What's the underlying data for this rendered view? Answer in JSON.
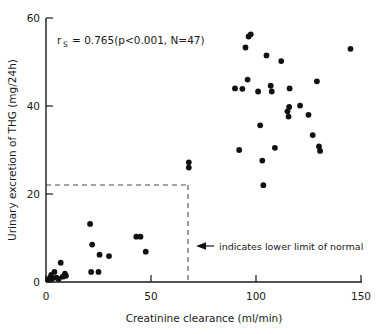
{
  "chart_data": {
    "type": "scatter",
    "title": "",
    "xlabel": "Creatinine clearance (ml/min)",
    "ylabel": "Urinary excretion of THG (mg/24h)",
    "xlim": [
      0,
      150
    ],
    "ylim": [
      0,
      60
    ],
    "xticks": [
      "0",
      "50",
      "100",
      "150"
    ],
    "xtick_values": [
      0,
      50,
      100,
      150
    ],
    "yticks": [
      "0",
      "20",
      "40",
      "60"
    ],
    "ytick_values": [
      0,
      20,
      40,
      60
    ],
    "grid": false,
    "legend": "none",
    "marker": "filled-circle",
    "marker_color": "#101010",
    "series": [
      {
        "name": "Patients",
        "points": [
          [
            1,
            0.6
          ],
          [
            2,
            1.0
          ],
          [
            2.5,
            1.6
          ],
          [
            3,
            0.8
          ],
          [
            4,
            2.3
          ],
          [
            5,
            1.0
          ],
          [
            6,
            0.7
          ],
          [
            7,
            4.4
          ],
          [
            8,
            1.2
          ],
          [
            9,
            1.9
          ],
          [
            9.5,
            1.4
          ],
          [
            21,
            13.2
          ],
          [
            21.5,
            2.3
          ],
          [
            22,
            8.5
          ],
          [
            25,
            2.3
          ],
          [
            25.5,
            6.2
          ],
          [
            30,
            5.9
          ],
          [
            43,
            10.3
          ],
          [
            45,
            10.3
          ],
          [
            47.5,
            6.9
          ],
          [
            68,
            27.2
          ],
          [
            68,
            26.0
          ],
          [
            90,
            44.0
          ],
          [
            92,
            30.0
          ],
          [
            93.5,
            43.9
          ],
          [
            95,
            53.3
          ],
          [
            96,
            46.0
          ],
          [
            96.5,
            55.8
          ],
          [
            97.5,
            56.3
          ],
          [
            101,
            43.3
          ],
          [
            102,
            35.6
          ],
          [
            103,
            27.6
          ],
          [
            103.5,
            22.0
          ],
          [
            105,
            51.5
          ],
          [
            107,
            44.6
          ],
          [
            107.5,
            43.3
          ],
          [
            109,
            30.5
          ],
          [
            112,
            50.2
          ],
          [
            115,
            38.8
          ],
          [
            115.5,
            37.6
          ],
          [
            115.8,
            39.8
          ],
          [
            116,
            44.0
          ],
          [
            121,
            40.1
          ],
          [
            125,
            38.0
          ],
          [
            127,
            33.4
          ],
          [
            129,
            45.6
          ],
          [
            130,
            30.8
          ],
          [
            130.5,
            29.8
          ],
          [
            145,
            53.0
          ]
        ]
      }
    ],
    "annotations": {
      "statistic_symbol": "r",
      "statistic_subscript": "S",
      "statistic_body": "= 0.765(p<0.001, N=47)",
      "reference_note": "indicates lower limit of normal",
      "reference_lines": {
        "horizontal_y": 22,
        "vertical_x": 70,
        "style": "dashed"
      }
    }
  },
  "axes": {
    "x_title": "Creatinine clearance (ml/min)",
    "y_title": "Urinary excretion of THG (mg/24h)",
    "x_tick_labels": [
      "0",
      "50",
      "100",
      "150"
    ],
    "y_tick_labels": [
      "0",
      "20",
      "40",
      "60"
    ]
  },
  "stat_box": {
    "symbol": "r",
    "subscript": "S",
    "value_text": "= 0.765(p<0.001, N=47)"
  },
  "callout": {
    "text": "indicates lower limit of normal",
    "arrow": "left-arrow-icon"
  },
  "colors": {
    "marker": "#101010",
    "axis": "#1a1a1a",
    "dashed": "#4a4a4a",
    "background": "#ffffff"
  }
}
